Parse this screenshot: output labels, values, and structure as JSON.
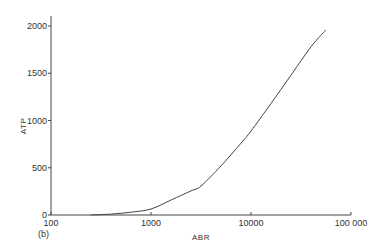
{
  "chart_data": {
    "type": "line",
    "title": "",
    "panel_label": "(b)",
    "xlabel": "ABR",
    "ylabel": "ATP",
    "xscale": "log",
    "xlim": [
      100,
      100000
    ],
    "ylim": [
      0,
      2000
    ],
    "grid": false,
    "legend": null,
    "x_ticks": [
      100,
      1000,
      10000,
      100000
    ],
    "x_tick_labels": [
      "100",
      "1000",
      "10000",
      "100 000"
    ],
    "y_ticks": [
      0,
      500,
      1000,
      1500,
      2000
    ],
    "y_tick_labels": [
      "0",
      "500",
      "1000",
      "1500",
      "2000"
    ],
    "series": [
      {
        "name": "ATP vs ABR",
        "x": [
          250,
          400,
          631,
          1000,
          1585,
          2512,
          3162,
          5012,
          7943,
          10000,
          15849,
          25119,
          39811,
          56000
        ],
        "y": [
          0,
          10,
          30,
          63,
          159,
          255,
          307,
          520,
          760,
          889,
          1180,
          1480,
          1780,
          1958
        ]
      }
    ]
  }
}
